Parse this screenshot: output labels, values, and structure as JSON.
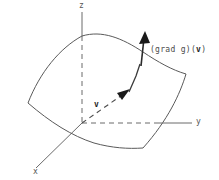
{
  "figure": {
    "axes": {
      "z_label": "z",
      "y_label": "y",
      "x_label": "x"
    },
    "annotations": {
      "gradient_prefix": "(grad g)(",
      "gradient_vector": "v",
      "gradient_suffix": ")",
      "tangent_vector": "v"
    },
    "colors": {
      "axis": "#6b6b6b",
      "surface": "#5a5a5a",
      "arrow": "#1a1a1a",
      "background": "#ffffff"
    }
  }
}
